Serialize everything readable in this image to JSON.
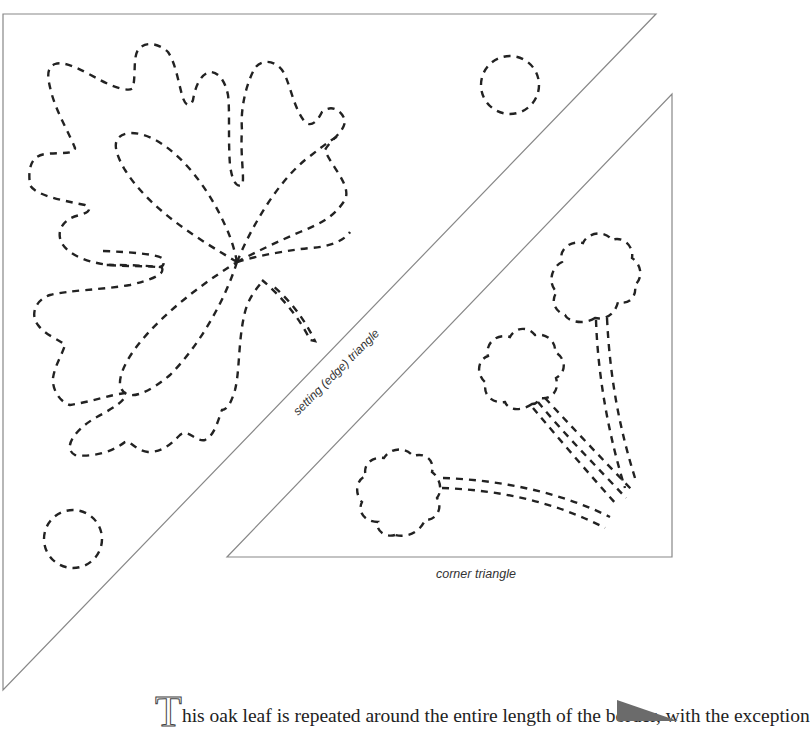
{
  "labels": {
    "setting_triangle": "setting (edge) triangle",
    "corner_triangle": "corner triangle"
  },
  "body": {
    "drop_cap": "T",
    "text": "his oak leaf is repeated around the entire length of the border, with the exception"
  },
  "colors": {
    "outline": "#888888",
    "stitch": "#222222",
    "page_marker": "#6b6b6b"
  }
}
